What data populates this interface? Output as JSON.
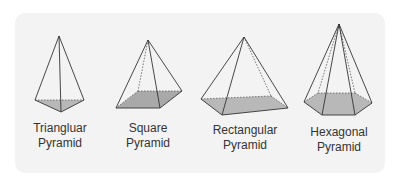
{
  "figure": {
    "background_color": "#f3f3f3",
    "base_fill_color": "#b8b8b8",
    "edge_color": "#333333",
    "shapes": [
      {
        "id": "triangular",
        "label_line1": "Triangluar",
        "label_line2": "Pyramid"
      },
      {
        "id": "square",
        "label_line1": "Square",
        "label_line2": "Pyramid"
      },
      {
        "id": "rectangular",
        "label_line1": "Rectangular",
        "label_line2": "Pyramid"
      },
      {
        "id": "hexagonal",
        "label_line1": "Hexagonal",
        "label_line2": "Pyramid"
      }
    ]
  }
}
